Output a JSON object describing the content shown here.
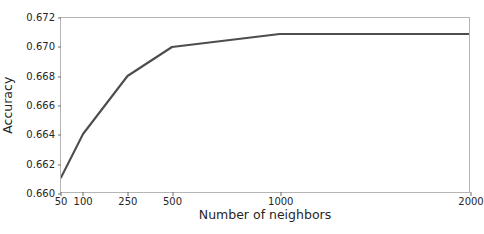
{
  "chart_data": {
    "type": "line",
    "title": "",
    "xlabel": "Number of neighbors",
    "ylabel": "Accuracy",
    "x": [
      50,
      100,
      250,
      500,
      1000,
      2000
    ],
    "xtick_labels": [
      "50",
      "100",
      "250",
      "500",
      "1000",
      "2000"
    ],
    "xtick_positions": [
      0,
      0.054,
      0.163,
      0.272,
      0.536,
      1.0
    ],
    "values": [
      0.661,
      0.664,
      0.668,
      0.67,
      0.6709,
      0.6709
    ],
    "series": [
      {
        "name": "Accuracy",
        "values": [
          0.661,
          0.664,
          0.668,
          0.67,
          0.6709,
          0.6709
        ]
      }
    ],
    "ylim": [
      0.66,
      0.672
    ],
    "ytick_labels": [
      "0.660",
      "0.662",
      "0.664",
      "0.666",
      "0.668",
      "0.670",
      "0.672"
    ],
    "ytick_values": [
      0.66,
      0.662,
      0.664,
      0.666,
      0.668,
      0.67,
      0.672
    ],
    "grid": false,
    "legend": "none",
    "line_color": "#4d4d4d",
    "axis_color": "#b5b5b5",
    "text_color": "#262626",
    "background_color": "#ffffff"
  }
}
